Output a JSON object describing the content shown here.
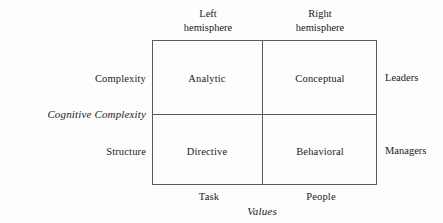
{
  "diagram": {
    "axes": {
      "y_axis_label": "Cognitive Complexity",
      "x_axis_label": "Values"
    },
    "column_headers": [
      {
        "line1": "Left",
        "line2": "hemisphere"
      },
      {
        "line1": "Right",
        "line2": "hemisphere"
      }
    ],
    "row_labels_left": [
      "Complexity",
      "Structure"
    ],
    "row_labels_right": [
      "Leaders",
      "Managers"
    ],
    "column_footers": [
      "Task",
      "People"
    ],
    "cells": [
      {
        "label": "Analytic",
        "row": "Complexity",
        "column": "Left hemisphere"
      },
      {
        "label": "Conceptual",
        "row": "Complexity",
        "column": "Right hemisphere"
      },
      {
        "label": "Directive",
        "row": "Structure",
        "column": "Left hemisphere"
      },
      {
        "label": "Behavioral",
        "row": "Structure",
        "column": "Right hemisphere"
      }
    ],
    "colors": {
      "background": "#fdfdfd",
      "line": "#5a5a5a",
      "text": "#1b1b1b"
    }
  }
}
